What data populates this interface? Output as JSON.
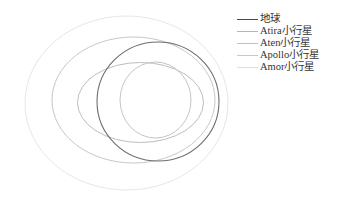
{
  "chart_data": {
    "type": "diagram",
    "title": "",
    "orbits": [
      {
        "name": "地球",
        "cx": 158,
        "cy": 101.5,
        "rx": 61,
        "ry": 59.5,
        "color": "#6e6e6e",
        "width": 1.1
      },
      {
        "name": "Atira小行星",
        "cx": 140.5,
        "cy": 102.5,
        "rx": 63,
        "ry": 40,
        "color": "#bdbdbd",
        "width": 1
      },
      {
        "name": "Aten小行星",
        "cx": 155.5,
        "cy": 100,
        "rx": 35.5,
        "ry": 38,
        "color": "#c4c4c4",
        "width": 1
      },
      {
        "name": "Apollo小行星",
        "cx": 133.5,
        "cy": 100,
        "rx": 81.5,
        "ry": 63,
        "color": "#c8c8c8",
        "width": 1
      },
      {
        "name": "Amor小行星",
        "cx": 126.5,
        "cy": 103,
        "rx": 101.5,
        "ry": 87,
        "color": "#e6e6e6",
        "width": 1
      }
    ],
    "legend": [
      {
        "label": "地球",
        "color": "#4a4a4a"
      },
      {
        "label": "Atira小行星",
        "color": "#b5b5b5"
      },
      {
        "label": "Aten小行星",
        "color": "#c0c0c0"
      },
      {
        "label": "Apollo小行星",
        "color": "#c8c8c8"
      },
      {
        "label": "Amor小行星",
        "color": "#dedede"
      }
    ],
    "legend_position": "upper right"
  },
  "legend": {
    "items": [
      {
        "label": "地球"
      },
      {
        "label": "Atira小行星"
      },
      {
        "label": "Aten小行星"
      },
      {
        "label": "Apollo小行星"
      },
      {
        "label": "Amor小行星"
      }
    ]
  }
}
